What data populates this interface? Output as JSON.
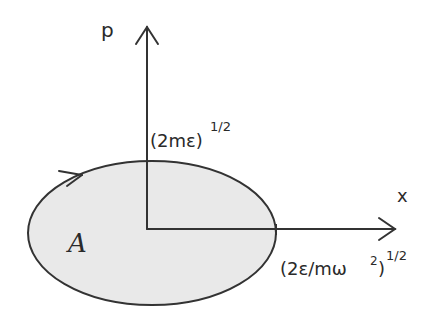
{
  "diagram": {
    "type": "phase-space ellipse",
    "axes": {
      "vertical_label": "p",
      "horizontal_label": "x"
    },
    "ellipse": {
      "area_label": "A",
      "fill": "#e9e9e9",
      "stroke": "#333333",
      "orientation_arrow": "clockwise"
    },
    "intercepts": {
      "p_max": {
        "base": "(2mε)",
        "exponent": "1/2"
      },
      "x_max": {
        "base": "(2ε/mω",
        "sq": "2",
        "close": ")",
        "exponent": "1/2"
      }
    }
  }
}
